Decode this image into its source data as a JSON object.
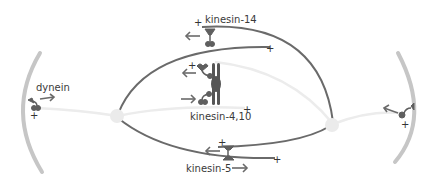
{
  "diagram": {
    "colors": {
      "cortex": "#c4c4c4",
      "microtubule_dark": "#6a6a6a",
      "astral_microtubule": "#ececec",
      "pole": "#ececec",
      "motor": "#5f5f5f",
      "arrow": "#6a6a6a",
      "text": "#3a3a3a"
    },
    "labels": {
      "dynein": "dynein",
      "kinesin14": "kinesin-14",
      "kinesin4_10": "kinesin-4,10",
      "kinesin5": "kinesin-5"
    },
    "plus_sign": "+",
    "motors": [
      {
        "name": "dynein",
        "location": "left cortex",
        "direction": "right"
      },
      {
        "name": "dynein",
        "location": "right cortex",
        "direction": "left"
      },
      {
        "name": "kinesin-14",
        "location": "top antiparallel overlap",
        "direction": "left"
      },
      {
        "name": "kinesin-4,10",
        "location": "chromosome arm",
        "directions": [
          "left",
          "right"
        ]
      },
      {
        "name": "kinesin-5",
        "location": "bottom antiparallel overlap",
        "directions": [
          "left",
          "right"
        ]
      }
    ]
  }
}
